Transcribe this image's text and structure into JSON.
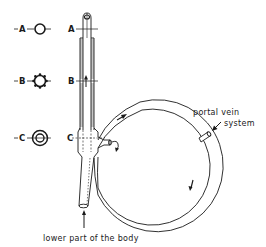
{
  "diagram": {
    "cross_sections": [
      {
        "id": "A",
        "label": "A",
        "shape": "plain-circle"
      },
      {
        "id": "B",
        "label": "B",
        "shape": "gear-circle"
      },
      {
        "id": "C",
        "label": "C",
        "shape": "concentric-circles"
      }
    ],
    "tube_markers": [
      {
        "label": "A"
      },
      {
        "label": "B"
      },
      {
        "label": "C"
      }
    ],
    "annotations": {
      "portal_vein_line1": "portal vein",
      "portal_vein_line2": "system",
      "bottom_label": "lower part of the body"
    },
    "colors": {
      "ink": "#1a1a1a",
      "background": "#ffffff"
    }
  }
}
